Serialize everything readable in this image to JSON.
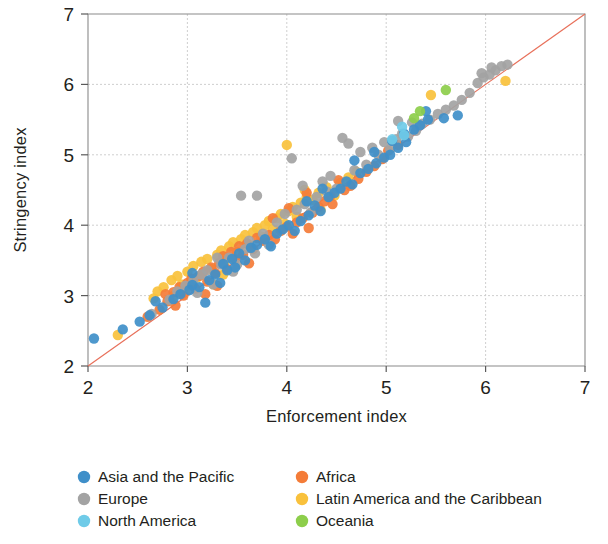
{
  "chart_data": {
    "type": "scatter",
    "title": "",
    "xlabel": "Enforcement index",
    "ylabel": "Stringency index",
    "xlim": [
      2,
      7
    ],
    "ylim": [
      2,
      7
    ],
    "xticks": [
      2,
      3,
      4,
      5,
      6,
      7
    ],
    "yticks": [
      2,
      3,
      4,
      5,
      6,
      7
    ],
    "grid": true,
    "legend_position": "bottom",
    "reference_line": {
      "name": "45-degree line",
      "from": [
        2,
        2
      ],
      "to": [
        7,
        7
      ],
      "color": "#e8705a"
    },
    "colors": {
      "asia_pacific": "#3f8fc9",
      "africa": "#f47c38",
      "europe": "#a3a3a3",
      "latin_america_caribbean": "#f9c13c",
      "north_america": "#6fcbe8",
      "oceania": "#8dce4b"
    },
    "series": [
      {
        "name": "Asia and the Pacific",
        "color": "#3f8fc9",
        "points": [
          [
            2.06,
            2.39
          ],
          [
            2.35,
            2.52
          ],
          [
            2.52,
            2.63
          ],
          [
            2.62,
            2.72
          ],
          [
            2.75,
            2.83
          ],
          [
            2.86,
            2.95
          ],
          [
            2.93,
            3.02
          ],
          [
            3.02,
            3.08
          ],
          [
            3.05,
            3.15
          ],
          [
            3.12,
            3.12
          ],
          [
            3.18,
            2.9
          ],
          [
            3.22,
            3.22
          ],
          [
            3.28,
            3.3
          ],
          [
            3.33,
            3.18
          ],
          [
            3.36,
            3.45
          ],
          [
            3.4,
            3.36
          ],
          [
            3.45,
            3.52
          ],
          [
            3.52,
            3.6
          ],
          [
            3.58,
            3.5
          ],
          [
            3.64,
            3.68
          ],
          [
            3.7,
            3.72
          ],
          [
            3.78,
            3.8
          ],
          [
            3.84,
            3.7
          ],
          [
            3.9,
            3.88
          ],
          [
            3.96,
            3.94
          ],
          [
            4.02,
            4.0
          ],
          [
            4.08,
            3.92
          ],
          [
            4.14,
            4.06
          ],
          [
            4.22,
            4.14
          ],
          [
            4.28,
            4.28
          ],
          [
            4.34,
            4.2
          ],
          [
            4.42,
            4.4
          ],
          [
            4.48,
            4.46
          ],
          [
            4.54,
            4.52
          ],
          [
            4.6,
            4.62
          ],
          [
            4.66,
            4.58
          ],
          [
            4.74,
            4.74
          ],
          [
            4.82,
            4.8
          ],
          [
            4.9,
            4.88
          ],
          [
            4.98,
            4.96
          ],
          [
            5.04,
            5.0
          ],
          [
            5.12,
            5.1
          ],
          [
            5.2,
            5.18
          ],
          [
            5.28,
            5.36
          ],
          [
            5.34,
            5.42
          ],
          [
            5.06,
            5.2
          ],
          [
            5.18,
            5.3
          ],
          [
            5.42,
            5.5
          ],
          [
            5.58,
            5.52
          ],
          [
            5.72,
            5.56
          ],
          [
            4.68,
            4.92
          ],
          [
            4.88,
            5.04
          ],
          [
            5.4,
            5.62
          ],
          [
            3.05,
            3.32
          ],
          [
            2.68,
            2.92
          ],
          [
            3.48,
            3.4
          ],
          [
            4.36,
            4.52
          ],
          [
            4.2,
            4.34
          ]
        ]
      },
      {
        "name": "Africa",
        "color": "#f47c38",
        "points": [
          [
            2.6,
            2.7
          ],
          [
            2.72,
            2.8
          ],
          [
            2.8,
            2.92
          ],
          [
            2.86,
            3.05
          ],
          [
            2.92,
            3.12
          ],
          [
            2.96,
            3.0
          ],
          [
            3.0,
            3.18
          ],
          [
            3.04,
            3.24
          ],
          [
            3.08,
            3.1
          ],
          [
            3.12,
            3.28
          ],
          [
            3.16,
            3.34
          ],
          [
            3.2,
            3.2
          ],
          [
            3.24,
            3.4
          ],
          [
            3.28,
            3.32
          ],
          [
            3.32,
            3.46
          ],
          [
            3.36,
            3.56
          ],
          [
            3.4,
            3.38
          ],
          [
            3.44,
            3.62
          ],
          [
            3.48,
            3.52
          ],
          [
            3.52,
            3.7
          ],
          [
            3.56,
            3.58
          ],
          [
            3.6,
            3.74
          ],
          [
            3.66,
            3.66
          ],
          [
            3.7,
            3.82
          ],
          [
            3.76,
            3.78
          ],
          [
            3.82,
            3.86
          ],
          [
            3.88,
            3.8
          ],
          [
            3.94,
            3.92
          ],
          [
            4.0,
            3.98
          ],
          [
            4.06,
            3.88
          ],
          [
            4.1,
            4.04
          ],
          [
            4.16,
            4.1
          ],
          [
            4.22,
            3.96
          ],
          [
            4.26,
            4.18
          ],
          [
            4.32,
            4.26
          ],
          [
            4.38,
            4.34
          ],
          [
            4.44,
            4.42
          ],
          [
            4.52,
            4.64
          ],
          [
            4.58,
            4.5
          ],
          [
            4.64,
            4.56
          ],
          [
            4.72,
            4.66
          ],
          [
            4.8,
            4.76
          ],
          [
            4.88,
            4.84
          ],
          [
            4.96,
            4.94
          ],
          [
            5.02,
            5.06
          ],
          [
            5.12,
            5.14
          ],
          [
            3.18,
            3.02
          ],
          [
            3.3,
            3.14
          ],
          [
            2.88,
            2.86
          ],
          [
            4.46,
            4.3
          ],
          [
            4.02,
            4.24
          ],
          [
            3.86,
            4.1
          ],
          [
            4.2,
            4.46
          ],
          [
            2.78,
            3.02
          ],
          [
            3.62,
            3.46
          ]
        ]
      },
      {
        "name": "Europe",
        "color": "#a3a3a3",
        "points": [
          [
            2.64,
            2.74
          ],
          [
            2.82,
            2.94
          ],
          [
            2.9,
            3.06
          ],
          [
            2.98,
            3.14
          ],
          [
            3.06,
            3.22
          ],
          [
            3.1,
            3.04
          ],
          [
            3.14,
            3.3
          ],
          [
            3.2,
            3.36
          ],
          [
            3.26,
            3.16
          ],
          [
            3.34,
            3.44
          ],
          [
            3.42,
            3.54
          ],
          [
            3.5,
            3.44
          ],
          [
            3.54,
            4.42
          ],
          [
            3.58,
            3.66
          ],
          [
            3.62,
            3.78
          ],
          [
            3.68,
            3.6
          ],
          [
            3.76,
            3.88
          ],
          [
            3.82,
            3.72
          ],
          [
            3.9,
            4.04
          ],
          [
            3.98,
            4.16
          ],
          [
            4.05,
            4.95
          ],
          [
            4.1,
            4.22
          ],
          [
            4.18,
            4.3
          ],
          [
            4.24,
            4.18
          ],
          [
            4.3,
            4.4
          ],
          [
            4.36,
            4.62
          ],
          [
            4.44,
            4.7
          ],
          [
            4.5,
            4.52
          ],
          [
            4.56,
            5.24
          ],
          [
            4.62,
            5.16
          ],
          [
            4.68,
            4.78
          ],
          [
            4.74,
            5.04
          ],
          [
            4.8,
            4.86
          ],
          [
            4.86,
            5.1
          ],
          [
            4.92,
            5.0
          ],
          [
            4.98,
            5.18
          ],
          [
            5.04,
            5.08
          ],
          [
            5.1,
            5.22
          ],
          [
            5.16,
            5.3
          ],
          [
            5.22,
            5.26
          ],
          [
            5.3,
            5.34
          ],
          [
            5.36,
            5.44
          ],
          [
            5.44,
            5.5
          ],
          [
            5.52,
            5.58
          ],
          [
            5.6,
            5.64
          ],
          [
            5.68,
            5.7
          ],
          [
            5.76,
            5.78
          ],
          [
            5.84,
            5.88
          ],
          [
            5.92,
            6.02
          ],
          [
            5.98,
            6.1
          ],
          [
            6.04,
            6.14
          ],
          [
            6.1,
            6.2
          ],
          [
            6.16,
            6.26
          ],
          [
            6.22,
            6.28
          ],
          [
            6.06,
            6.24
          ],
          [
            5.96,
            6.16
          ],
          [
            3.7,
            4.42
          ],
          [
            4.4,
            4.48
          ],
          [
            3.46,
            3.34
          ],
          [
            5.12,
            5.48
          ],
          [
            5.26,
            5.46
          ],
          [
            4.16,
            4.56
          ],
          [
            3.3,
            3.54
          ]
        ]
      },
      {
        "name": "Latin America and the Caribbean",
        "color": "#f9c13c",
        "points": [
          [
            2.3,
            2.44
          ],
          [
            2.7,
            3.06
          ],
          [
            2.76,
            3.12
          ],
          [
            2.84,
            3.22
          ],
          [
            2.9,
            3.28
          ],
          [
            2.94,
            3.16
          ],
          [
            3.0,
            3.34
          ],
          [
            3.06,
            3.42
          ],
          [
            3.1,
            3.26
          ],
          [
            3.14,
            3.48
          ],
          [
            3.2,
            3.52
          ],
          [
            3.24,
            3.38
          ],
          [
            3.3,
            3.58
          ],
          [
            3.34,
            3.64
          ],
          [
            3.38,
            3.5
          ],
          [
            3.42,
            3.7
          ],
          [
            3.46,
            3.76
          ],
          [
            3.5,
            3.62
          ],
          [
            3.54,
            3.8
          ],
          [
            3.58,
            3.86
          ],
          [
            3.62,
            3.72
          ],
          [
            3.66,
            3.9
          ],
          [
            3.7,
            3.96
          ],
          [
            3.74,
            3.84
          ],
          [
            3.78,
            4.0
          ],
          [
            3.82,
            4.06
          ],
          [
            3.86,
            3.94
          ],
          [
            3.9,
            4.1
          ],
          [
            3.94,
            4.16
          ],
          [
            3.98,
            4.02
          ],
          [
            4.02,
            4.2
          ],
          [
            4.06,
            4.26
          ],
          [
            4.1,
            4.12
          ],
          [
            4.14,
            4.32
          ],
          [
            4.2,
            4.4
          ],
          [
            4.26,
            4.36
          ],
          [
            4.32,
            4.46
          ],
          [
            4.4,
            4.54
          ],
          [
            4.48,
            4.42
          ],
          [
            4.54,
            4.6
          ],
          [
            4.62,
            4.68
          ],
          [
            4.7,
            4.76
          ],
          [
            4.0,
            5.14
          ],
          [
            5.45,
            5.85
          ],
          [
            6.2,
            6.05
          ],
          [
            2.98,
            3.08
          ],
          [
            3.04,
            3.2
          ],
          [
            2.86,
            3.0
          ],
          [
            4.34,
            4.22
          ],
          [
            3.26,
            3.16
          ],
          [
            2.66,
            2.96
          ],
          [
            4.18,
            4.5
          ],
          [
            3.36,
            3.3
          ]
        ]
      },
      {
        "name": "North America",
        "color": "#6fcbe8",
        "points": [
          [
            5.16,
            5.4
          ],
          [
            5.18,
            5.28
          ],
          [
            5.06,
            5.22
          ]
        ]
      },
      {
        "name": "Oceania",
        "color": "#8dce4b",
        "points": [
          [
            5.28,
            5.52
          ],
          [
            5.6,
            5.92
          ],
          [
            5.34,
            5.62
          ]
        ]
      }
    ]
  },
  "legend": {
    "items": [
      {
        "label": "Asia and the Pacific",
        "color": "#3f8fc9"
      },
      {
        "label": "Africa",
        "color": "#f47c38"
      },
      {
        "label": "Europe",
        "color": "#a3a3a3"
      },
      {
        "label": "Latin America and the Caribbean",
        "color": "#f9c13c"
      },
      {
        "label": "North America",
        "color": "#6fcbe8"
      },
      {
        "label": "Oceania",
        "color": "#8dce4b"
      }
    ]
  }
}
